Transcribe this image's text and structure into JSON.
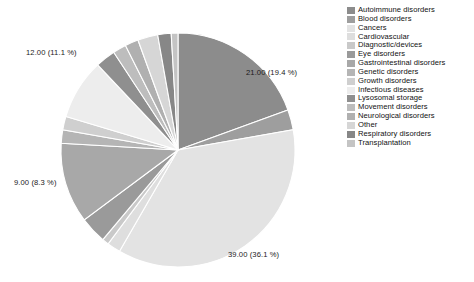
{
  "chart_data": {
    "type": "pie",
    "title": "",
    "total": 108,
    "legend_position": "right",
    "categories": [
      "Autoimmune disorders",
      "Blood disorders",
      "Cancers",
      "Cardiovascular",
      "Diagnostic/devices",
      "Eye disorders",
      "Gastrointestinal disorders",
      "Genetic disorders",
      "Growth disorders",
      "Infectious diseases",
      "Lysosomal storage",
      "Movement disorders",
      "Neurological disorders",
      "Other",
      "Respiratory disorders",
      "Transplantation"
    ],
    "values": [
      21,
      3,
      39,
      2,
      1,
      4,
      12,
      2,
      2,
      9,
      3,
      2,
      2,
      3,
      2,
      1
    ],
    "colors": [
      "#8c8c8c",
      "#9e9e9e",
      "#e3e3e3",
      "#dedede",
      "#c9c9c9",
      "#9a9a9a",
      "#a8a8a8",
      "#b5b5b5",
      "#cfcfcf",
      "#ededed",
      "#8f8f8f",
      "#bdbdbd",
      "#b0b0b0",
      "#d6d6d6",
      "#878787",
      "#c4c4c4"
    ],
    "labels": [
      {
        "text": "21.00 (19.4 %)",
        "value": 21,
        "percent": 19.4,
        "x": 246,
        "y": 68
      },
      {
        "text": "39.00 (36.1 %)",
        "value": 39,
        "percent": 36.1,
        "x": 228,
        "y": 250
      },
      {
        "text": "9.00 (8.3 %)",
        "value": 9,
        "percent": 8.3,
        "x": 14,
        "y": 178
      },
      {
        "text": "12.00 (11.1 %)",
        "value": 12,
        "percent": 11.1,
        "x": 26,
        "y": 48
      }
    ],
    "geometry": {
      "cx": 178,
      "cy": 150,
      "r": 117,
      "start_angle": -90
    }
  },
  "legend": {
    "items": [
      {
        "label": "Autoimmune disorders",
        "color": "#8c8c8c"
      },
      {
        "label": "Blood disorders",
        "color": "#9e9e9e"
      },
      {
        "label": "Cancers",
        "color": "#e3e3e3"
      },
      {
        "label": "Cardiovascular",
        "color": "#dedede"
      },
      {
        "label": "Diagnostic/devices",
        "color": "#c9c9c9"
      },
      {
        "label": "Eye disorders",
        "color": "#9a9a9a"
      },
      {
        "label": "Gastrointestinal disorders",
        "color": "#a8a8a8"
      },
      {
        "label": "Genetic disorders",
        "color": "#b5b5b5"
      },
      {
        "label": "Growth disorders",
        "color": "#cfcfcf"
      },
      {
        "label": "Infectious diseases",
        "color": "#ededed"
      },
      {
        "label": "Lysosomal storage",
        "color": "#8f8f8f"
      },
      {
        "label": "Movement disorders",
        "color": "#bdbdbd"
      },
      {
        "label": "Neurological disorders",
        "color": "#b0b0b0"
      },
      {
        "label": "Other",
        "color": "#d6d6d6"
      },
      {
        "label": "Respiratory disorders",
        "color": "#878787"
      },
      {
        "label": "Transplantation",
        "color": "#c4c4c4"
      }
    ]
  }
}
